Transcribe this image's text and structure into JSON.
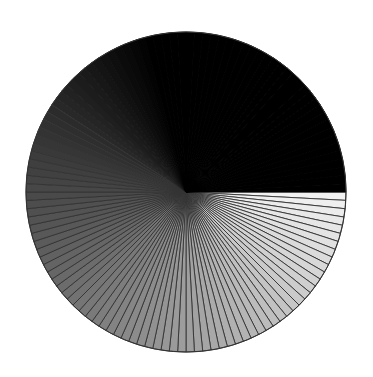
{
  "chart_data": {
    "type": "pie",
    "title": "",
    "legend": [],
    "slice_count": 120,
    "values": [
      1,
      1,
      1,
      1,
      1,
      1,
      1,
      1,
      1,
      1,
      1,
      1,
      1,
      1,
      1,
      1,
      1,
      1,
      1,
      1,
      1,
      1,
      1,
      1,
      1,
      1,
      1,
      1,
      1,
      1,
      1,
      1,
      1,
      1,
      1,
      1,
      1,
      1,
      1,
      1,
      1,
      1,
      1,
      1,
      1,
      1,
      1,
      1,
      1,
      1,
      1,
      1,
      1,
      1,
      1,
      1,
      1,
      1,
      1,
      1,
      1,
      1,
      1,
      1,
      1,
      1,
      1,
      1,
      1,
      1,
      1,
      1,
      1,
      1,
      1,
      1,
      1,
      1,
      1,
      1,
      1,
      1,
      1,
      1,
      1,
      1,
      1,
      1,
      1,
      1,
      1,
      1,
      1,
      1,
      1,
      1,
      1,
      1,
      1,
      1,
      1,
      1,
      1,
      1,
      1,
      1,
      1,
      1,
      1,
      1,
      1,
      1,
      1,
      1,
      1,
      1,
      1,
      1,
      1,
      1
    ],
    "start_angle_deg": 0,
    "direction": "clockwise",
    "color_scale": {
      "type": "grayscale-linear",
      "start_gray": 242,
      "end_gray": 0,
      "black_from_slice": 85
    },
    "edge_color": "#333333",
    "center": [
      186,
      192
    ],
    "radius": 160
  }
}
